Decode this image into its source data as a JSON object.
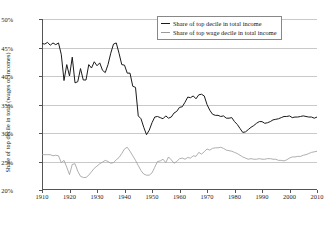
{
  "chart_data": {
    "type": "line",
    "title": "",
    "xlabel": "",
    "ylabel": "Share of top decile in total (wages or incomes)",
    "xlim": [
      1910,
      2010
    ],
    "ylim": [
      20,
      50
    ],
    "grid": true,
    "legend_position": "top-right",
    "ytick_labels": [
      "50%",
      "45%",
      "40%",
      "35%",
      "30%",
      "25%",
      "20%"
    ],
    "ytick_values": [
      50,
      45,
      40,
      35,
      30,
      25,
      20
    ],
    "xtick_labels": [
      "1910",
      "1920",
      "1930",
      "1940",
      "1950",
      "1960",
      "1970",
      "1980",
      "1990",
      "2000",
      "2010"
    ],
    "xtick_values": [
      1910,
      1920,
      1930,
      1940,
      1950,
      1960,
      1970,
      1980,
      1990,
      2000,
      2010
    ],
    "x": [
      1910,
      1911,
      1912,
      1913,
      1914,
      1915,
      1916,
      1917,
      1918,
      1919,
      1920,
      1921,
      1922,
      1923,
      1924,
      1925,
      1926,
      1927,
      1928,
      1929,
      1930,
      1931,
      1932,
      1933,
      1934,
      1935,
      1936,
      1937,
      1938,
      1939,
      1940,
      1941,
      1942,
      1943,
      1944,
      1945,
      1946,
      1947,
      1948,
      1949,
      1950,
      1951,
      1952,
      1953,
      1954,
      1955,
      1956,
      1957,
      1958,
      1959,
      1960,
      1961,
      1962,
      1963,
      1964,
      1965,
      1966,
      1967,
      1968,
      1969,
      1970,
      1971,
      1972,
      1973,
      1974,
      1975,
      1976,
      1977,
      1978,
      1979,
      1980,
      1981,
      1982,
      1983,
      1984,
      1985,
      1986,
      1987,
      1988,
      1989,
      1990,
      1991,
      1992,
      1993,
      1994,
      1995,
      1996,
      1997,
      1998,
      1999,
      2000,
      2001,
      2002,
      2003,
      2004,
      2005,
      2006,
      2007,
      2008,
      2009,
      2010
    ],
    "series": [
      {
        "name": "Share of top decile in total income",
        "color": "#1a1a1a",
        "values": [
          45.7,
          45.6,
          45.9,
          45.4,
          45.8,
          45.5,
          45.8,
          43.8,
          39.2,
          42.0,
          40.0,
          43.3,
          38.8,
          39.0,
          41.3,
          39.3,
          39.3,
          42.0,
          41.4,
          42.5,
          41.8,
          42.3,
          41.0,
          40.6,
          42.0,
          44.0,
          45.6,
          45.8,
          44.0,
          42.0,
          41.9,
          40.5,
          40.5,
          38.2,
          38.0,
          33.0,
          32.5,
          31.0,
          29.7,
          30.5,
          31.8,
          32.8,
          32.9,
          32.7,
          32.5,
          33.0,
          32.6,
          32.8,
          33.5,
          33.8,
          34.5,
          34.6,
          35.4,
          36.3,
          36.2,
          36.5,
          36.0,
          36.7,
          36.8,
          36.5,
          35.0,
          34.0,
          33.3,
          33.1,
          33.1,
          32.9,
          33.0,
          32.6,
          32.6,
          32.7,
          32.0,
          31.5,
          30.8,
          30.1,
          30.2,
          30.6,
          31.0,
          31.3,
          31.7,
          32.0,
          32.0,
          31.7,
          31.8,
          32.0,
          32.3,
          32.4,
          32.5,
          32.7,
          32.9,
          32.9,
          33.0,
          32.7,
          32.8,
          32.8,
          32.9,
          33.0,
          32.9,
          32.8,
          32.8,
          32.6,
          32.8
        ]
      },
      {
        "name": "Share of top wage decile in total income",
        "color": "#9a9a9a",
        "values": [
          26.2,
          26.2,
          26.2,
          26.2,
          26.0,
          26.1,
          26.0,
          24.8,
          25.2,
          24.0,
          22.7,
          24.5,
          24.6,
          23.3,
          22.4,
          22.2,
          22.2,
          22.6,
          23.2,
          23.8,
          24.2,
          24.6,
          24.9,
          25.2,
          25.0,
          24.7,
          24.8,
          25.3,
          25.7,
          26.4,
          27.2,
          27.5,
          26.8,
          26.0,
          25.2,
          24.3,
          23.4,
          22.8,
          22.6,
          22.6,
          23.0,
          24.0,
          25.0,
          25.1,
          25.4,
          24.8,
          25.8,
          25.3,
          24.7,
          25.0,
          25.5,
          25.6,
          25.4,
          25.7,
          25.6,
          26.0,
          25.9,
          26.6,
          26.3,
          26.7,
          27.2,
          27.0,
          27.3,
          27.4,
          27.4,
          27.5,
          27.3,
          27.0,
          26.9,
          26.8,
          26.6,
          26.4,
          26.1,
          25.8,
          25.6,
          25.4,
          25.5,
          25.4,
          25.4,
          25.5,
          25.4,
          25.4,
          25.5,
          25.5,
          25.4,
          25.4,
          25.2,
          25.2,
          25.1,
          25.3,
          25.6,
          25.8,
          25.8,
          25.9,
          25.9,
          26.1,
          26.2,
          26.4,
          26.6,
          26.7,
          26.8
        ]
      }
    ]
  },
  "legend": {
    "items": [
      {
        "label": "Share of top decile in total income"
      },
      {
        "label": "Share of top wage decile in total income"
      }
    ]
  }
}
